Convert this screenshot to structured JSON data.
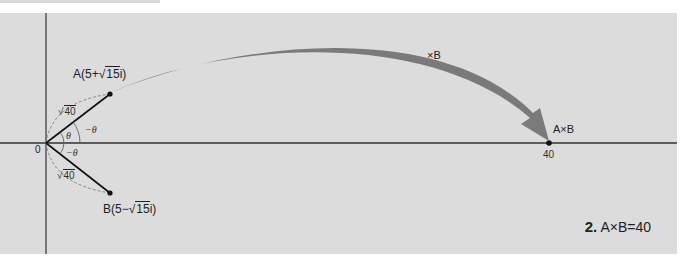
{
  "diagram": {
    "type": "complex-plane-multiplication",
    "origin_label": "0",
    "point_a": {
      "label_prefix": "A(5+",
      "sqrt_value": "15",
      "label_suffix": "i)"
    },
    "point_b": {
      "label_prefix": "B(5−",
      "sqrt_value": "15",
      "label_suffix": "i)"
    },
    "modulus_a": {
      "sqrt_value": "40"
    },
    "modulus_b": {
      "sqrt_value": "40"
    },
    "angle_theta": "θ",
    "angle_neg_theta_upper": "−θ",
    "angle_neg_theta_lower": "−θ",
    "arrow_label": "×B",
    "product_label": "A×B",
    "product_tick": "40",
    "colors": {
      "panel": "#dcdcdc",
      "axis": "#333333",
      "arrow": "#7a7a7a",
      "dashed": "#888888"
    }
  },
  "caption": {
    "number": "2.",
    "text": "A×B=40"
  }
}
